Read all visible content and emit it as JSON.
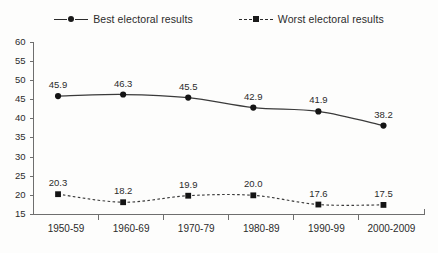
{
  "legend": {
    "position": "top-center",
    "entries": [
      {
        "label": "Best electoral results",
        "marker": "circle-marker-icon",
        "line_style": "solid"
      },
      {
        "label": "Worst electoral results",
        "marker": "square-marker-icon",
        "line_style": "dashed"
      }
    ]
  },
  "chart_data": {
    "type": "line",
    "title": "",
    "subtitle": "",
    "xlabel": "",
    "ylabel": "",
    "categories": [
      "1950-59",
      "1960-69",
      "1970-79",
      "1980-89",
      "1990-99",
      "2000-2009"
    ],
    "series": [
      {
        "name": "Best electoral results",
        "values": [
          45.9,
          46.3,
          45.5,
          42.9,
          41.9,
          38.2
        ],
        "marker": "circle",
        "line_style": "solid",
        "color": "#3a3a3a"
      },
      {
        "name": "Worst electoral results",
        "values": [
          20.3,
          18.2,
          19.9,
          20.0,
          17.6,
          17.5
        ],
        "marker": "square",
        "line_style": "dashed",
        "color": "#3a3a3a"
      }
    ],
    "ylim": [
      15,
      60
    ],
    "ytick_step": 5,
    "yticks": [
      15,
      20,
      25,
      30,
      35,
      40,
      45,
      50,
      55,
      60
    ],
    "ytick_labels": [
      "15",
      "20",
      "25",
      "30",
      "35",
      "40",
      "45",
      "50",
      "55",
      "60"
    ],
    "grid": false,
    "data_labels": true,
    "legend_position": "top-center"
  }
}
